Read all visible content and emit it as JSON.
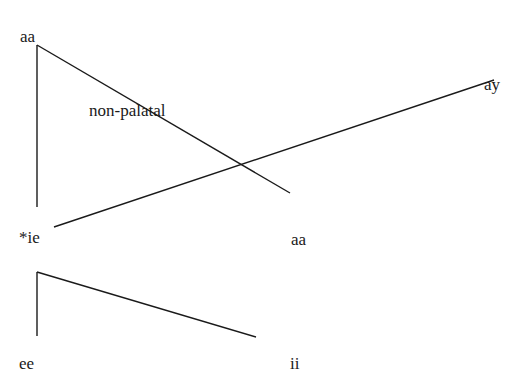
{
  "labels": {
    "top_aa": "aa",
    "ay": "ay",
    "non_palatal": "non-palatal",
    "star_ie": "*ie",
    "mid_aa": "aa",
    "ee": "ee",
    "ii": "ii"
  },
  "colors": {
    "line": "#1a1a1a",
    "background": "#ffffff"
  },
  "lines": [
    {
      "name": "aa-vertical",
      "x1": 37,
      "y1": 45,
      "x2": 37,
      "y2": 207
    },
    {
      "name": "aa-diagonal",
      "x1": 37,
      "y1": 45,
      "x2": 290,
      "y2": 193
    },
    {
      "name": "ie-to-ay",
      "x1": 54,
      "y1": 227,
      "x2": 494,
      "y2": 80
    },
    {
      "name": "ee-vertical",
      "x1": 37,
      "y1": 272,
      "x2": 37,
      "y2": 336
    },
    {
      "name": "ee-diagonal",
      "x1": 37,
      "y1": 272,
      "x2": 256,
      "y2": 337
    }
  ]
}
